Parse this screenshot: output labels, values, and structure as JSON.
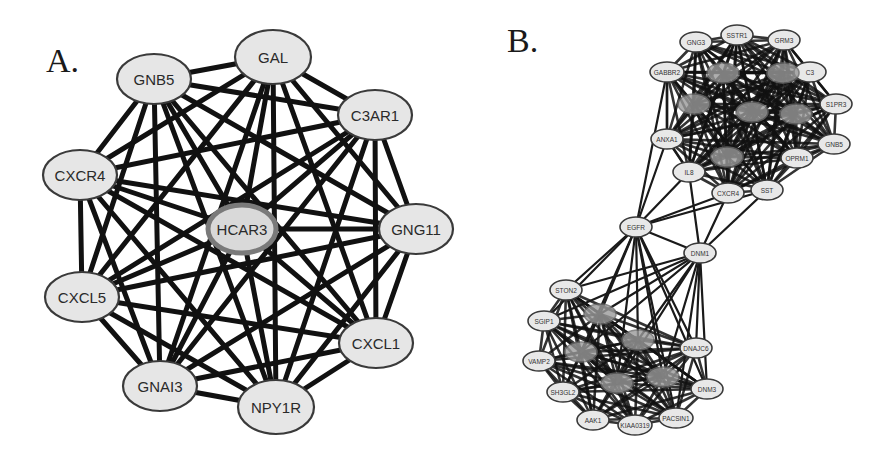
{
  "figure": {
    "panels": [
      {
        "label": "A.",
        "nodes": [
          {
            "id": "GAL",
            "label": "GAL",
            "x": 273,
            "y": 57,
            "rx": 38,
            "ry": 27,
            "hub": false
          },
          {
            "id": "GNB5",
            "label": "GNB5",
            "x": 154,
            "y": 79,
            "rx": 37,
            "ry": 25,
            "hub": false
          },
          {
            "id": "C3AR1",
            "label": "C3AR1",
            "x": 375,
            "y": 115,
            "rx": 37,
            "ry": 25,
            "hub": false
          },
          {
            "id": "CXCR4",
            "label": "CXCR4",
            "x": 80,
            "y": 175,
            "rx": 37,
            "ry": 25,
            "hub": false
          },
          {
            "id": "HCAR3",
            "label": "HCAR3",
            "x": 242,
            "y": 229,
            "rx": 34,
            "ry": 24,
            "hub": true
          },
          {
            "id": "GNG11",
            "label": "GNG11",
            "x": 416,
            "y": 229,
            "rx": 37,
            "ry": 25,
            "hub": false
          },
          {
            "id": "CXCL5",
            "label": "CXCL5",
            "x": 82,
            "y": 297,
            "rx": 37,
            "ry": 25,
            "hub": false
          },
          {
            "id": "CXCL1",
            "label": "CXCL1",
            "x": 376,
            "y": 343,
            "rx": 37,
            "ry": 25,
            "hub": false
          },
          {
            "id": "GNAI3",
            "label": "GNAI3",
            "x": 160,
            "y": 386,
            "rx": 37,
            "ry": 25,
            "hub": false
          },
          {
            "id": "NPY1R",
            "label": "NPY1R",
            "x": 276,
            "y": 407,
            "rx": 38,
            "ry": 27,
            "hub": false
          }
        ],
        "fully_connected": true
      },
      {
        "label": "B.",
        "nodes": [
          {
            "id": "GNG3",
            "label": "GNG3",
            "x": 696,
            "y": 42,
            "rx": 16,
            "ry": 10,
            "hub": false
          },
          {
            "id": "SSTR1",
            "label": "SSTR1",
            "x": 737,
            "y": 35,
            "rx": 16,
            "ry": 10,
            "hub": false
          },
          {
            "id": "GRM3",
            "label": "GRM3",
            "x": 784,
            "y": 40,
            "rx": 16,
            "ry": 10,
            "hub": false
          },
          {
            "id": "GABBR2",
            "label": "GABBR2",
            "x": 667,
            "y": 72,
            "rx": 17,
            "ry": 10,
            "hub": false
          },
          {
            "id": "C3",
            "label": "C3",
            "x": 810,
            "y": 72,
            "rx": 16,
            "ry": 10,
            "hub": false
          },
          {
            "id": "S1PR3",
            "label": "S1PR3",
            "x": 836,
            "y": 104,
            "rx": 16,
            "ry": 10,
            "hub": false
          },
          {
            "id": "GNB5B",
            "label": "GNB5",
            "x": 834,
            "y": 144,
            "rx": 16,
            "ry": 10,
            "hub": false
          },
          {
            "id": "ANXA1",
            "label": "ANXA1",
            "x": 667,
            "y": 139,
            "rx": 16,
            "ry": 10,
            "hub": false
          },
          {
            "id": "IL8",
            "label": "IL8",
            "x": 689,
            "y": 172,
            "rx": 16,
            "ry": 10,
            "hub": false
          },
          {
            "id": "CXCR4B",
            "label": "CXCR4",
            "x": 728,
            "y": 193,
            "rx": 16,
            "ry": 10,
            "hub": false
          },
          {
            "id": "SST",
            "label": "SST",
            "x": 767,
            "y": 190,
            "rx": 16,
            "ry": 10,
            "hub": false
          },
          {
            "id": "OPRM1",
            "label": "OPRM1",
            "x": 797,
            "y": 158,
            "rx": 16,
            "ry": 10,
            "hub": false
          },
          {
            "id": "H1",
            "label": "",
            "x": 723,
            "y": 73,
            "rx": 16,
            "ry": 10,
            "hub": true
          },
          {
            "id": "H2",
            "label": "",
            "x": 783,
            "y": 73,
            "rx": 16,
            "ry": 10,
            "hub": true
          },
          {
            "id": "H3",
            "label": "",
            "x": 694,
            "y": 104,
            "rx": 16,
            "ry": 10,
            "hub": true
          },
          {
            "id": "H4",
            "label": "",
            "x": 752,
            "y": 112,
            "rx": 16,
            "ry": 10,
            "hub": true
          },
          {
            "id": "H5",
            "label": "",
            "x": 796,
            "y": 114,
            "rx": 16,
            "ry": 10,
            "hub": true
          },
          {
            "id": "H6",
            "label": "",
            "x": 727,
            "y": 157,
            "rx": 16,
            "ry": 10,
            "hub": true
          },
          {
            "id": "EGFR",
            "label": "EGFR",
            "x": 636,
            "y": 227,
            "rx": 16,
            "ry": 10,
            "hub": false
          },
          {
            "id": "DNM1",
            "label": "DNM1",
            "x": 700,
            "y": 253,
            "rx": 16,
            "ry": 10,
            "hub": false
          },
          {
            "id": "STON2",
            "label": "STON2",
            "x": 566,
            "y": 290,
            "rx": 16,
            "ry": 10,
            "hub": false
          },
          {
            "id": "SGIP1",
            "label": "SGIP1",
            "x": 544,
            "y": 321,
            "rx": 16,
            "ry": 10,
            "hub": false
          },
          {
            "id": "VAMP2",
            "label": "VAMP2",
            "x": 539,
            "y": 361,
            "rx": 16,
            "ry": 10,
            "hub": false
          },
          {
            "id": "SH3GL2",
            "label": "SH3GL2",
            "x": 563,
            "y": 392,
            "rx": 16,
            "ry": 10,
            "hub": false
          },
          {
            "id": "AAK1",
            "label": "AAK1",
            "x": 593,
            "y": 420,
            "rx": 16,
            "ry": 10,
            "hub": false
          },
          {
            "id": "KIAA0319",
            "label": "KIAA0319",
            "x": 635,
            "y": 425,
            "rx": 17,
            "ry": 10,
            "hub": false
          },
          {
            "id": "PACSIN1",
            "label": "PACSIN1",
            "x": 676,
            "y": 418,
            "rx": 17,
            "ry": 10,
            "hub": false
          },
          {
            "id": "DNM3",
            "label": "DNM3",
            "x": 707,
            "y": 389,
            "rx": 16,
            "ry": 10,
            "hub": false
          },
          {
            "id": "DNAJC6",
            "label": "DNAJC6",
            "x": 696,
            "y": 348,
            "rx": 16,
            "ry": 10,
            "hub": false
          },
          {
            "id": "L1",
            "label": "",
            "x": 600,
            "y": 314,
            "rx": 16,
            "ry": 10,
            "hub": true
          },
          {
            "id": "L2",
            "label": "",
            "x": 638,
            "y": 340,
            "rx": 16,
            "ry": 10,
            "hub": true
          },
          {
            "id": "L3",
            "label": "",
            "x": 581,
            "y": 352,
            "rx": 16,
            "ry": 10,
            "hub": true
          },
          {
            "id": "L4",
            "label": "",
            "x": 617,
            "y": 383,
            "rx": 16,
            "ry": 10,
            "hub": true
          },
          {
            "id": "L5",
            "label": "",
            "x": 663,
            "y": 377,
            "rx": 16,
            "ry": 10,
            "hub": true
          }
        ],
        "clusters": [
          [
            "GNG3",
            "SSTR1",
            "GRM3",
            "GABBR2",
            "C3",
            "S1PR3",
            "GNB5B",
            "ANXA1",
            "IL8",
            "CXCR4B",
            "SST",
            "OPRM1",
            "H1",
            "H2",
            "H3",
            "H4",
            "H5",
            "H6"
          ],
          [
            "STON2",
            "SGIP1",
            "VAMP2",
            "SH3GL2",
            "AAK1",
            "KIAA0319",
            "PACSIN1",
            "DNM3",
            "DNAJC6",
            "L1",
            "L2",
            "L3",
            "L4",
            "L5"
          ]
        ],
        "bridge_edges": [
          [
            "EGFR",
            "IL8"
          ],
          [
            "EGFR",
            "CXCR4B"
          ],
          [
            "EGFR",
            "SST"
          ],
          [
            "EGFR",
            "ANXA1"
          ],
          [
            "EGFR",
            "GABBR2"
          ],
          [
            "EGFR",
            "DNM1"
          ],
          [
            "DNM1",
            "IL8"
          ],
          [
            "DNM1",
            "CXCR4B"
          ],
          [
            "DNM1",
            "SST"
          ],
          [
            "EGFR",
            "STON2"
          ],
          [
            "EGFR",
            "SGIP1"
          ],
          [
            "EGFR",
            "L1"
          ],
          [
            "EGFR",
            "L2"
          ],
          [
            "EGFR",
            "L3"
          ],
          [
            "EGFR",
            "L4"
          ],
          [
            "EGFR",
            "L5"
          ],
          [
            "EGFR",
            "DNAJC6"
          ],
          [
            "EGFR",
            "DNM3"
          ],
          [
            "EGFR",
            "PACSIN1"
          ],
          [
            "DNM1",
            "STON2"
          ],
          [
            "DNM1",
            "SGIP1"
          ],
          [
            "DNM1",
            "L1"
          ],
          [
            "DNM1",
            "L2"
          ],
          [
            "DNM1",
            "L3"
          ],
          [
            "DNM1",
            "L5"
          ],
          [
            "DNM1",
            "DNAJC6"
          ],
          [
            "DNM1",
            "DNM3"
          ],
          [
            "DNM1",
            "PACSIN1"
          ],
          [
            "DNM1",
            "L4"
          ],
          [
            "ANXA1",
            "IL8"
          ],
          [
            "GABBR2",
            "ANXA1"
          ]
        ]
      }
    ]
  }
}
